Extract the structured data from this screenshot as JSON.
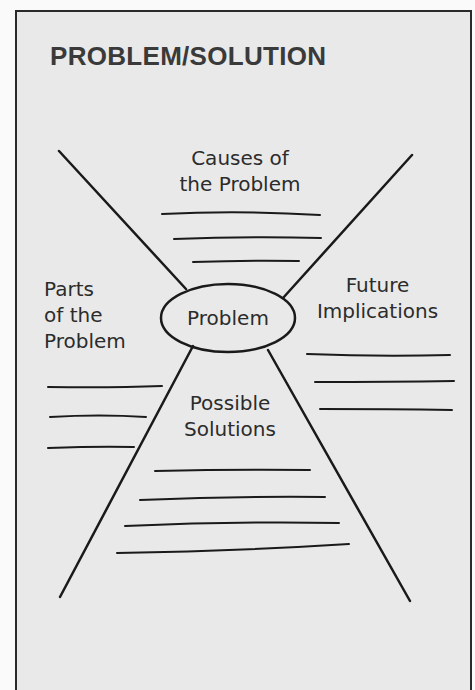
{
  "title": "PROBLEM/SOLUTION",
  "center": {
    "label": "Problem"
  },
  "sections": {
    "top": {
      "line1": "Causes of",
      "line2": "the Problem",
      "blank_lines": 3
    },
    "left": {
      "line1": "Parts",
      "line2": "of the",
      "line3": "Problem",
      "blank_lines": 3
    },
    "right": {
      "line1": "Future",
      "line2": "Implications",
      "blank_lines": 3
    },
    "bottom": {
      "line1": "Possible",
      "line2": "Solutions",
      "blank_lines": 4
    }
  },
  "colors": {
    "ink": "#1a1a1a",
    "paper": "#e9e9e9",
    "title": "#3a3a3a"
  }
}
